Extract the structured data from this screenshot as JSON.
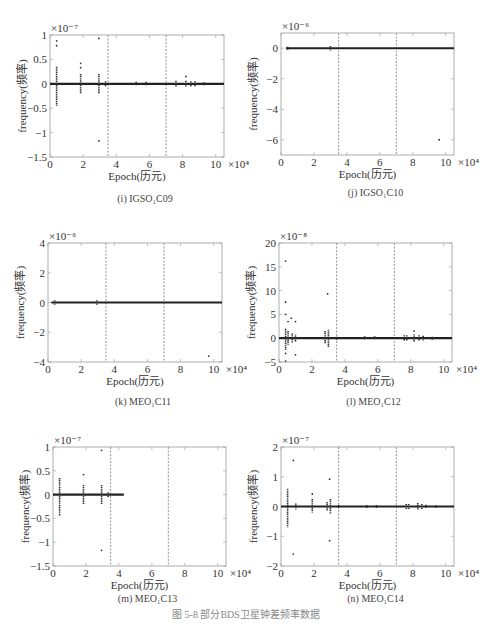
{
  "figure_caption": "图 5-8 部分BDS卫星钟差频率数据",
  "chart_data": [
    {
      "id": "i",
      "type": "scatter",
      "caption": "(i) IGSO₁C09",
      "title": "",
      "xlabel": "Epoch(历元)",
      "ylabel": "frequency(频率)",
      "x_exponent": "×10⁴",
      "y_exponent": "×10⁻⁷",
      "xlim": [
        0,
        10.5
      ],
      "ylim": [
        -1.5,
        1
      ],
      "xticks": [
        0,
        2,
        4,
        6,
        8,
        10
      ],
      "yticks": [
        -1.5,
        -1,
        -0.5,
        0,
        0.5,
        1
      ],
      "ytick_labels": [
        "-1.5",
        "-1",
        "-0.5",
        "0",
        "0.5",
        "1"
      ],
      "vlines": [
        3.5,
        7
      ],
      "baseline": {
        "x_start": 0,
        "x_end": 10.5,
        "y": 0
      },
      "clusters": [
        {
          "x": 0.4,
          "ymin": -0.45,
          "ymax": 0.35
        },
        {
          "x": 1.85,
          "ymin": -0.2,
          "ymax": 0.2
        },
        {
          "x": 2.95,
          "ymin": -0.2,
          "ymax": 0.2
        },
        {
          "x": 3.35,
          "ymin": -0.05,
          "ymax": 0.05
        },
        {
          "x": 5.2,
          "ymin": -0.04,
          "ymax": 0.04
        },
        {
          "x": 5.8,
          "ymin": -0.04,
          "ymax": 0.04
        },
        {
          "x": 7.6,
          "ymin": -0.06,
          "ymax": 0.06
        },
        {
          "x": 8.2,
          "ymin": -0.06,
          "ymax": 0.06
        },
        {
          "x": 8.5,
          "ymin": -0.05,
          "ymax": 0.05
        },
        {
          "x": 8.75,
          "ymin": -0.05,
          "ymax": 0.05
        },
        {
          "x": 9.3,
          "ymin": -0.03,
          "ymax": 0.03
        }
      ],
      "outliers": [
        [
          0.4,
          0.88
        ],
        [
          0.4,
          0.78
        ],
        [
          1.85,
          0.42
        ],
        [
          1.85,
          0.33
        ],
        [
          2.95,
          0.93
        ],
        [
          2.95,
          -1.17
        ],
        [
          8.2,
          0.15
        ]
      ]
    },
    {
      "id": "j",
      "type": "scatter",
      "caption": "(j) IGSO₁C10",
      "title": "",
      "xlabel": "Epoch(历元)",
      "ylabel": "frequency(频率)",
      "x_exponent": "×10⁴",
      "y_exponent": "×10⁻⁶",
      "xlim": [
        0,
        10.5
      ],
      "ylim": [
        -7,
        1
      ],
      "xticks": [
        0,
        2,
        4,
        6,
        8,
        10
      ],
      "yticks": [
        -6,
        -4,
        -2,
        0
      ],
      "ytick_labels": [
        "-6",
        "-4",
        "-2",
        "0"
      ],
      "vlines": [
        3.5,
        7
      ],
      "baseline": {
        "x_start": 0.3,
        "x_end": 10.5,
        "y": 0
      },
      "clusters": [
        {
          "x": 0.4,
          "ymin": -0.1,
          "ymax": 0.1
        },
        {
          "x": 3.0,
          "ymin": -0.15,
          "ymax": 0.15
        }
      ],
      "outliers": [
        [
          9.6,
          -6.0
        ]
      ]
    },
    {
      "id": "k",
      "type": "scatter",
      "caption": "(k) MEO₁C11",
      "title": "",
      "xlabel": "Epoch(历元)",
      "ylabel": "frequency(频率)",
      "x_exponent": "×10⁴",
      "y_exponent": "×10⁻⁶",
      "xlim": [
        0,
        10.5
      ],
      "ylim": [
        -4,
        4
      ],
      "xticks": [
        0,
        2,
        4,
        6,
        8,
        10
      ],
      "yticks": [
        -4,
        -2,
        0,
        2,
        4
      ],
      "ytick_labels": [
        "-4",
        "-2",
        "0",
        "2",
        "4"
      ],
      "vlines": [
        3.5,
        7
      ],
      "baseline": {
        "x_start": 0.2,
        "x_end": 10.5,
        "y": 0
      },
      "clusters": [
        {
          "x": 0.4,
          "ymin": -0.15,
          "ymax": 0.15
        },
        {
          "x": 2.95,
          "ymin": -0.15,
          "ymax": 0.15
        }
      ],
      "outliers": [
        [
          9.7,
          -3.6
        ]
      ]
    },
    {
      "id": "l",
      "type": "scatter",
      "caption": "(l) MEO₁C12",
      "title": "",
      "xlabel": "Epoch(历元)",
      "ylabel": "frequency(频率)",
      "x_exponent": "×10⁴",
      "y_exponent": "×10⁻⁸",
      "xlim": [
        0,
        10.5
      ],
      "ylim": [
        -5,
        20
      ],
      "xticks": [
        0,
        2,
        4,
        6,
        8,
        10
      ],
      "yticks": [
        -5,
        0,
        5,
        10,
        15,
        20
      ],
      "ytick_labels": [
        "-5",
        "0",
        "5",
        "10",
        "15",
        "20"
      ],
      "vlines": [
        3.5,
        7
      ],
      "baseline": {
        "x_start": 0,
        "x_end": 10.5,
        "y": 0
      },
      "clusters": [
        {
          "x": 0.4,
          "ymin": -2.5,
          "ymax": 2.0
        },
        {
          "x": 0.55,
          "ymin": -1.5,
          "ymax": 1.5
        },
        {
          "x": 0.8,
          "ymin": -1.0,
          "ymax": 1.0
        },
        {
          "x": 1.0,
          "ymin": -0.8,
          "ymax": 0.8
        },
        {
          "x": 2.8,
          "ymin": -1.2,
          "ymax": 1.5
        },
        {
          "x": 3.0,
          "ymin": -2.0,
          "ymax": 1.8
        },
        {
          "x": 3.5,
          "ymin": -0.3,
          "ymax": 0.3
        },
        {
          "x": 5.2,
          "ymin": -0.4,
          "ymax": 0.4
        },
        {
          "x": 5.8,
          "ymin": -0.4,
          "ymax": 0.4
        },
        {
          "x": 7.6,
          "ymin": -0.6,
          "ymax": 0.6
        },
        {
          "x": 7.75,
          "ymin": -0.6,
          "ymax": 0.6
        },
        {
          "x": 8.2,
          "ymin": -0.8,
          "ymax": 0.8
        },
        {
          "x": 8.5,
          "ymin": -0.6,
          "ymax": 0.6
        },
        {
          "x": 8.75,
          "ymin": -0.5,
          "ymax": 0.5
        },
        {
          "x": 9.3,
          "ymin": -0.3,
          "ymax": 0.3
        }
      ],
      "outliers": [
        [
          0.4,
          16.2
        ],
        [
          0.4,
          7.6
        ],
        [
          0.4,
          5.0
        ],
        [
          0.55,
          3.5
        ],
        [
          0.75,
          4.2
        ],
        [
          1.0,
          3.5
        ],
        [
          0.4,
          -3.2
        ],
        [
          0.4,
          -4.8
        ],
        [
          1.0,
          -3.5
        ],
        [
          2.95,
          9.3
        ],
        [
          8.2,
          1.5
        ]
      ]
    },
    {
      "id": "m",
      "type": "scatter",
      "caption": "(m) MEO₁C13",
      "title": "",
      "xlabel": "Epoch(历元)",
      "ylabel": "frequency(频率)",
      "x_exponent": "×10⁴",
      "y_exponent": "×10⁻⁷",
      "xlim": [
        0,
        10.5
      ],
      "ylim": [
        -1.5,
        1
      ],
      "xticks": [
        0,
        2,
        4,
        6,
        8,
        10
      ],
      "yticks": [
        -1.5,
        -1,
        -0.5,
        0,
        0.5,
        1
      ],
      "ytick_labels": [
        "-1.5",
        "-1",
        "-0.5",
        "0",
        "0.5",
        "1"
      ],
      "vlines": [
        3.5,
        7
      ],
      "baseline": {
        "x_start": 0,
        "x_end": 4.3,
        "y": 0
      },
      "clusters": [
        {
          "x": 0.4,
          "ymin": -0.45,
          "ymax": 0.35
        },
        {
          "x": 1.85,
          "ymin": -0.2,
          "ymax": 0.2
        },
        {
          "x": 2.95,
          "ymin": -0.2,
          "ymax": 0.2
        },
        {
          "x": 3.35,
          "ymin": -0.05,
          "ymax": 0.05
        }
      ],
      "outliers": [
        [
          1.85,
          0.42
        ],
        [
          2.95,
          0.93
        ],
        [
          2.95,
          -1.17
        ]
      ]
    },
    {
      "id": "n",
      "type": "scatter",
      "caption": "(n) MEO₁C14",
      "title": "",
      "xlabel": "Epoch(历元)",
      "ylabel": "frequency(频率)",
      "x_exponent": "×10⁴",
      "y_exponent": "×10⁻⁷",
      "xlim": [
        0,
        10.5
      ],
      "ylim": [
        -2,
        2
      ],
      "xticks": [
        0,
        2,
        4,
        6,
        8,
        10
      ],
      "yticks": [
        -2,
        -1,
        0,
        1,
        2
      ],
      "ytick_labels": [
        "-2",
        "-1",
        "0",
        "1",
        "2"
      ],
      "vlines": [
        3.5,
        7
      ],
      "baseline": {
        "x_start": 0,
        "x_end": 10.5,
        "y": 0
      },
      "clusters": [
        {
          "x": 0.4,
          "ymin": -0.7,
          "ymax": 0.6
        },
        {
          "x": 0.9,
          "ymin": -0.1,
          "ymax": 0.1
        },
        {
          "x": 1.9,
          "ymin": -0.2,
          "ymax": 0.25
        },
        {
          "x": 2.8,
          "ymin": -0.15,
          "ymax": 0.15
        },
        {
          "x": 3.0,
          "ymin": -0.25,
          "ymax": 0.25
        },
        {
          "x": 3.5,
          "ymin": -0.05,
          "ymax": 0.05
        },
        {
          "x": 5.2,
          "ymin": -0.05,
          "ymax": 0.05
        },
        {
          "x": 5.8,
          "ymin": -0.05,
          "ymax": 0.05
        },
        {
          "x": 7.6,
          "ymin": -0.08,
          "ymax": 0.08
        },
        {
          "x": 7.75,
          "ymin": -0.08,
          "ymax": 0.08
        },
        {
          "x": 8.3,
          "ymin": -0.1,
          "ymax": 0.12
        },
        {
          "x": 8.55,
          "ymin": -0.08,
          "ymax": 0.08
        },
        {
          "x": 8.8,
          "ymin": -0.06,
          "ymax": 0.06
        },
        {
          "x": 9.4,
          "ymin": -0.04,
          "ymax": 0.04
        }
      ],
      "outliers": [
        [
          0.75,
          1.55
        ],
        [
          0.75,
          -1.6
        ],
        [
          2.95,
          0.92
        ],
        [
          2.95,
          -1.15
        ],
        [
          1.9,
          0.42
        ]
      ]
    }
  ]
}
